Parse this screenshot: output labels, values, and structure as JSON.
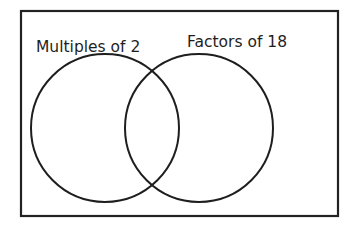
{
  "diagram": {
    "type": "venn",
    "frame": {
      "x": 21,
      "y": 11,
      "width": 317,
      "height": 205,
      "stroke": "#222222"
    },
    "sets": [
      {
        "label": "Multiples of 2",
        "cx": 105,
        "cy": 128,
        "r": 74,
        "label_x": 36,
        "label_y": 47
      },
      {
        "label": "Factors of 18",
        "cx": 199,
        "cy": 128,
        "r": 74,
        "label_x": 187,
        "label_y": 42
      }
    ],
    "stroke_color": "#1e1e1e"
  }
}
